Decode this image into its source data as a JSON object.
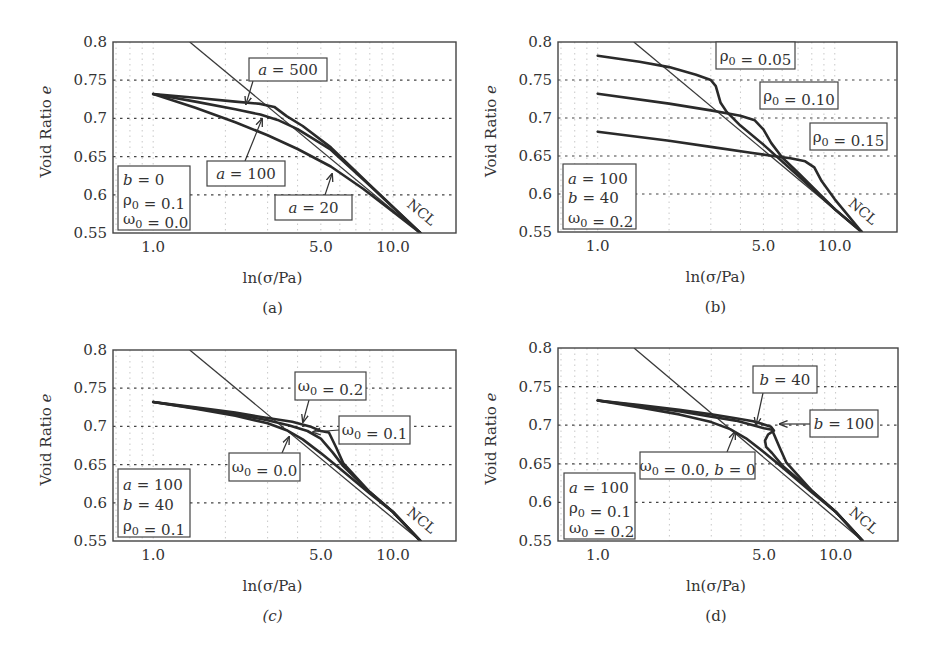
{
  "figure": {
    "panels_layout": "2x2"
  },
  "chart_data": [
    {
      "id": "a",
      "type": "line",
      "caption": "(a)",
      "xlabel": "ln(σ/Pa)",
      "ylabel": "Void Ratio e",
      "xscale": "log",
      "xlim": [
        0.68,
        18.3
      ],
      "ylim": [
        0.55,
        0.8
      ],
      "xticks": [
        {
          "v": 1,
          "label": "1.0"
        },
        {
          "v": 5,
          "label": "5.0"
        },
        {
          "v": 10,
          "label": "10.0"
        }
      ],
      "yticks": [
        {
          "v": 0.8,
          "label": "0.8"
        },
        {
          "v": 0.75,
          "label": "0.75"
        },
        {
          "v": 0.7,
          "label": "0.7"
        },
        {
          "v": 0.65,
          "label": "0.65"
        },
        {
          "v": 0.6,
          "label": "0.6"
        },
        {
          "v": 0.55,
          "label": "0.55"
        }
      ],
      "grid": true,
      "frame": {
        "x": 113,
        "y": 42,
        "w": 343,
        "h": 191
      },
      "params_box": {
        "lines": [
          "b = 0",
          "ρ0 = 0.1",
          "ω0 = 0.0"
        ],
        "x": 118,
        "y": 166,
        "w": 72,
        "h": 64
      },
      "ncl_label": "NCL",
      "series": [
        {
          "name": "NCL",
          "kind": "ncl",
          "x": [
            1.42,
            13.0
          ],
          "y": [
            0.8,
            0.55
          ]
        },
        {
          "name": "a = 500",
          "x": [
            1.0,
            1.5,
            2.2,
            2.8,
            3.2,
            3.6,
            4.2,
            5.5,
            8.0,
            13.0
          ],
          "y": [
            0.732,
            0.727,
            0.722,
            0.719,
            0.715,
            0.703,
            0.69,
            0.662,
            0.613,
            0.55
          ]
        },
        {
          "name": "a = 100",
          "x": [
            1.0,
            1.5,
            2.2,
            2.8,
            3.3,
            4.0,
            5.5,
            8.0,
            13.0
          ],
          "y": [
            0.732,
            0.722,
            0.712,
            0.705,
            0.698,
            0.686,
            0.659,
            0.612,
            0.55
          ]
        },
        {
          "name": "a = 20",
          "x": [
            1.0,
            1.5,
            2.2,
            3.0,
            4.0,
            5.5,
            7.5,
            10.0,
            13.0
          ],
          "y": [
            0.732,
            0.714,
            0.695,
            0.678,
            0.66,
            0.637,
            0.608,
            0.578,
            0.55
          ]
        }
      ],
      "annotations": [
        {
          "text": "a = 500",
          "x": 249,
          "y": 58,
          "w": 78,
          "h": 23,
          "arrow_from": [
            253,
            81
          ],
          "arrow_to": [
            246,
            104
          ]
        },
        {
          "text": "a = 100",
          "x": 207,
          "y": 161,
          "w": 78,
          "h": 25,
          "arrow_from": [
            245,
            161
          ],
          "arrow_to": [
            262,
            119
          ]
        },
        {
          "text": "a = 20",
          "x": 275,
          "y": 195,
          "w": 77,
          "h": 25,
          "arrow_from": [
            325,
            195
          ],
          "arrow_to": [
            332,
            174
          ]
        }
      ]
    },
    {
      "id": "b",
      "type": "line",
      "caption": "(b)",
      "xlabel": "ln(σ/Pa)",
      "ylabel": "Void Ratio e",
      "xscale": "log",
      "xlim": [
        0.68,
        18.3
      ],
      "ylim": [
        0.55,
        0.8
      ],
      "xticks": [
        {
          "v": 1,
          "label": "1.0"
        },
        {
          "v": 5,
          "label": "5.0"
        },
        {
          "v": 10,
          "label": "10.0"
        }
      ],
      "yticks": [
        {
          "v": 0.8,
          "label": "0.8"
        },
        {
          "v": 0.75,
          "label": "0.75"
        },
        {
          "v": 0.7,
          "label": "0.7"
        },
        {
          "v": 0.65,
          "label": "0.65"
        },
        {
          "v": 0.6,
          "label": "0.6"
        },
        {
          "v": 0.55,
          "label": "0.55"
        }
      ],
      "grid": true,
      "frame": {
        "x": 558,
        "y": 42,
        "w": 339,
        "h": 190
      },
      "params_box": {
        "lines": [
          "a = 100",
          "b = 40",
          "ω0 = 0.2"
        ],
        "x": 563,
        "y": 164,
        "w": 73,
        "h": 65
      },
      "ncl_label": "NCL",
      "series": [
        {
          "name": "NCL",
          "kind": "ncl",
          "x": [
            1.42,
            13.0
          ],
          "y": [
            0.8,
            0.55
          ]
        },
        {
          "name": "ρ0 = 0.05",
          "x": [
            1.0,
            1.5,
            2.0,
            2.6,
            3.0,
            3.15,
            3.3,
            3.5,
            4.0,
            5.0,
            7.0,
            10.0,
            13.0
          ],
          "y": [
            0.782,
            0.774,
            0.767,
            0.757,
            0.75,
            0.742,
            0.72,
            0.708,
            0.69,
            0.665,
            0.624,
            0.58,
            0.55
          ]
        },
        {
          "name": "ρ0 = 0.10",
          "x": [
            1.0,
            2.0,
            3.0,
            4.0,
            4.6,
            5.0,
            5.4,
            6.0,
            7.0,
            10.0,
            13.0
          ],
          "y": [
            0.732,
            0.719,
            0.71,
            0.703,
            0.697,
            0.685,
            0.667,
            0.648,
            0.628,
            0.58,
            0.55
          ]
        },
        {
          "name": "ρ0 = 0.15",
          "x": [
            1.0,
            2.0,
            3.0,
            4.5,
            5.5,
            6.5,
            7.5,
            8.2,
            8.8,
            10.0,
            13.0
          ],
          "y": [
            0.682,
            0.67,
            0.662,
            0.654,
            0.65,
            0.647,
            0.643,
            0.635,
            0.617,
            0.593,
            0.55
          ]
        }
      ],
      "annotations": [
        {
          "text": "ρ0 = 0.05",
          "x": 716,
          "y": 42,
          "w": 79,
          "h": 27
        },
        {
          "text": "ρ0 = 0.10",
          "x": 760,
          "y": 82,
          "w": 78,
          "h": 27
        },
        {
          "text": "ρ0 = 0.15",
          "x": 810,
          "y": 123,
          "w": 77,
          "h": 27
        }
      ]
    },
    {
      "id": "c",
      "type": "line",
      "caption": "(c)",
      "xlabel": "ln(σ/Pa)",
      "ylabel": "Void Ratio e",
      "xscale": "log",
      "xlim": [
        0.68,
        18.3
      ],
      "ylim": [
        0.55,
        0.8
      ],
      "xticks": [
        {
          "v": 1,
          "label": "1.0"
        },
        {
          "v": 5,
          "label": "5.0"
        },
        {
          "v": 10,
          "label": "10.0"
        }
      ],
      "yticks": [
        {
          "v": 0.8,
          "label": "0.8"
        },
        {
          "v": 0.75,
          "label": "0.75"
        },
        {
          "v": 0.7,
          "label": "0.7"
        },
        {
          "v": 0.65,
          "label": "0.65"
        },
        {
          "v": 0.6,
          "label": "0.6"
        },
        {
          "v": 0.55,
          "label": "0.55"
        }
      ],
      "grid": true,
      "frame": {
        "x": 113,
        "y": 350,
        "w": 343,
        "h": 191
      },
      "params_box": {
        "lines": [
          "a = 100",
          "b = 40",
          "ρ0 = 0.1"
        ],
        "x": 118,
        "y": 469,
        "w": 72,
        "h": 68
      },
      "ncl_label": "NCL",
      "series": [
        {
          "name": "NCL",
          "kind": "ncl",
          "x": [
            1.42,
            13.0
          ],
          "y": [
            0.8,
            0.55
          ]
        },
        {
          "name": "ω0 = 0.0",
          "x": [
            1.0,
            1.5,
            2.2,
            3.0,
            3.6,
            4.2,
            5.0,
            6.0,
            8.0,
            10.0,
            13.0
          ],
          "y": [
            0.732,
            0.723,
            0.714,
            0.704,
            0.695,
            0.683,
            0.665,
            0.645,
            0.612,
            0.588,
            0.55
          ]
        },
        {
          "name": "ω0 = 0.1",
          "x": [
            1.0,
            1.5,
            2.2,
            3.0,
            3.7,
            4.4,
            5.0,
            5.6,
            6.2,
            8.0,
            10.0,
            13.0
          ],
          "y": [
            0.732,
            0.724,
            0.716,
            0.708,
            0.701,
            0.694,
            0.684,
            0.666,
            0.648,
            0.614,
            0.588,
            0.55
          ]
        },
        {
          "name": "ω0 = 0.2",
          "x": [
            1.0,
            1.5,
            2.2,
            3.0,
            3.8,
            4.5,
            5.0,
            5.4,
            5.8,
            6.2,
            8.0,
            10.0,
            13.0
          ],
          "y": [
            0.732,
            0.725,
            0.718,
            0.711,
            0.706,
            0.7,
            0.694,
            0.692,
            0.672,
            0.652,
            0.614,
            0.588,
            0.55
          ]
        }
      ],
      "annotations": [
        {
          "text": "ω0 = 0.2",
          "x": 295,
          "y": 372,
          "w": 71,
          "h": 28,
          "arrow_from": [
            309,
            400
          ],
          "arrow_to": [
            303,
            422
          ]
        },
        {
          "text": "ω0 = 0.1",
          "x": 339,
          "y": 416,
          "w": 71,
          "h": 28,
          "arrow_from": [
            339,
            430
          ],
          "arrow_to": [
            313,
            432
          ]
        },
        {
          "text": "ω0 = 0.0",
          "x": 229,
          "y": 453,
          "w": 71,
          "h": 28,
          "arrow_from": [
            282,
            453
          ],
          "arrow_to": [
            289,
            437
          ]
        }
      ]
    },
    {
      "id": "d",
      "type": "line",
      "caption": "(d)",
      "xlabel": "ln(σ/Pa)",
      "ylabel": "Void Ratio e",
      "xscale": "log",
      "xlim": [
        0.68,
        18.3
      ],
      "ylim": [
        0.55,
        0.8
      ],
      "xticks": [
        {
          "v": 1,
          "label": "1.0"
        },
        {
          "v": 5,
          "label": "5.0"
        },
        {
          "v": 10,
          "label": "10.0"
        }
      ],
      "yticks": [
        {
          "v": 0.8,
          "label": "0.8"
        },
        {
          "v": 0.75,
          "label": "0.75"
        },
        {
          "v": 0.7,
          "label": "0.7"
        },
        {
          "v": 0.65,
          "label": "0.65"
        },
        {
          "v": 0.6,
          "label": "0.6"
        },
        {
          "v": 0.55,
          "label": "0.55"
        }
      ],
      "grid": true,
      "frame": {
        "x": 558,
        "y": 348,
        "w": 340,
        "h": 193
      },
      "params_box": {
        "lines": [
          "a = 100",
          "ρ0 = 0.1",
          "ω0 = 0.2"
        ],
        "x": 564,
        "y": 473,
        "w": 71,
        "h": 66
      },
      "ncl_label": "NCL",
      "series": [
        {
          "name": "NCL",
          "kind": "ncl",
          "x": [
            1.42,
            13.0
          ],
          "y": [
            0.8,
            0.55
          ]
        },
        {
          "name": "ω0 = 0.0, b = 0",
          "x": [
            1.0,
            1.5,
            2.2,
            3.0,
            3.6,
            4.2,
            5.0,
            6.0,
            8.0,
            10.0,
            13.0
          ],
          "y": [
            0.732,
            0.723,
            0.714,
            0.704,
            0.695,
            0.683,
            0.665,
            0.645,
            0.612,
            0.588,
            0.55
          ]
        },
        {
          "name": "b = 40",
          "x": [
            1.0,
            1.5,
            2.2,
            3.0,
            3.8,
            4.5,
            5.0,
            5.4,
            5.8,
            6.2,
            8.0,
            10.0,
            13.0
          ],
          "y": [
            0.732,
            0.725,
            0.718,
            0.711,
            0.706,
            0.7,
            0.696,
            0.694,
            0.672,
            0.652,
            0.614,
            0.588,
            0.55
          ]
        },
        {
          "name": "b = 100",
          "x": [
            1.0,
            1.5,
            2.2,
            3.0,
            3.8,
            4.5,
            5.0,
            5.35,
            5.5,
            5.2,
            5.05,
            5.1,
            5.4,
            6.0,
            8.0,
            10.0,
            13.0
          ],
          "y": [
            0.732,
            0.726,
            0.72,
            0.714,
            0.709,
            0.705,
            0.701,
            0.698,
            0.693,
            0.688,
            0.68,
            0.672,
            0.664,
            0.647,
            0.614,
            0.588,
            0.55
          ]
        }
      ],
      "annotations": [
        {
          "text": "b = 40",
          "x": 753,
          "y": 366,
          "w": 64,
          "h": 27,
          "arrow_from": [
            763,
            393
          ],
          "arrow_to": [
            756,
            425
          ]
        },
        {
          "text": "b = 100",
          "x": 810,
          "y": 410,
          "w": 68,
          "h": 27,
          "arrow_from": [
            810,
            424
          ],
          "arrow_to": [
            780,
            424
          ]
        },
        {
          "text": "ω0 = 0.0, b = 0",
          "x": 640,
          "y": 452,
          "w": 115,
          "h": 27,
          "arrow_from": [
            727,
            452
          ],
          "arrow_to": [
            735,
            432
          ]
        }
      ]
    }
  ]
}
